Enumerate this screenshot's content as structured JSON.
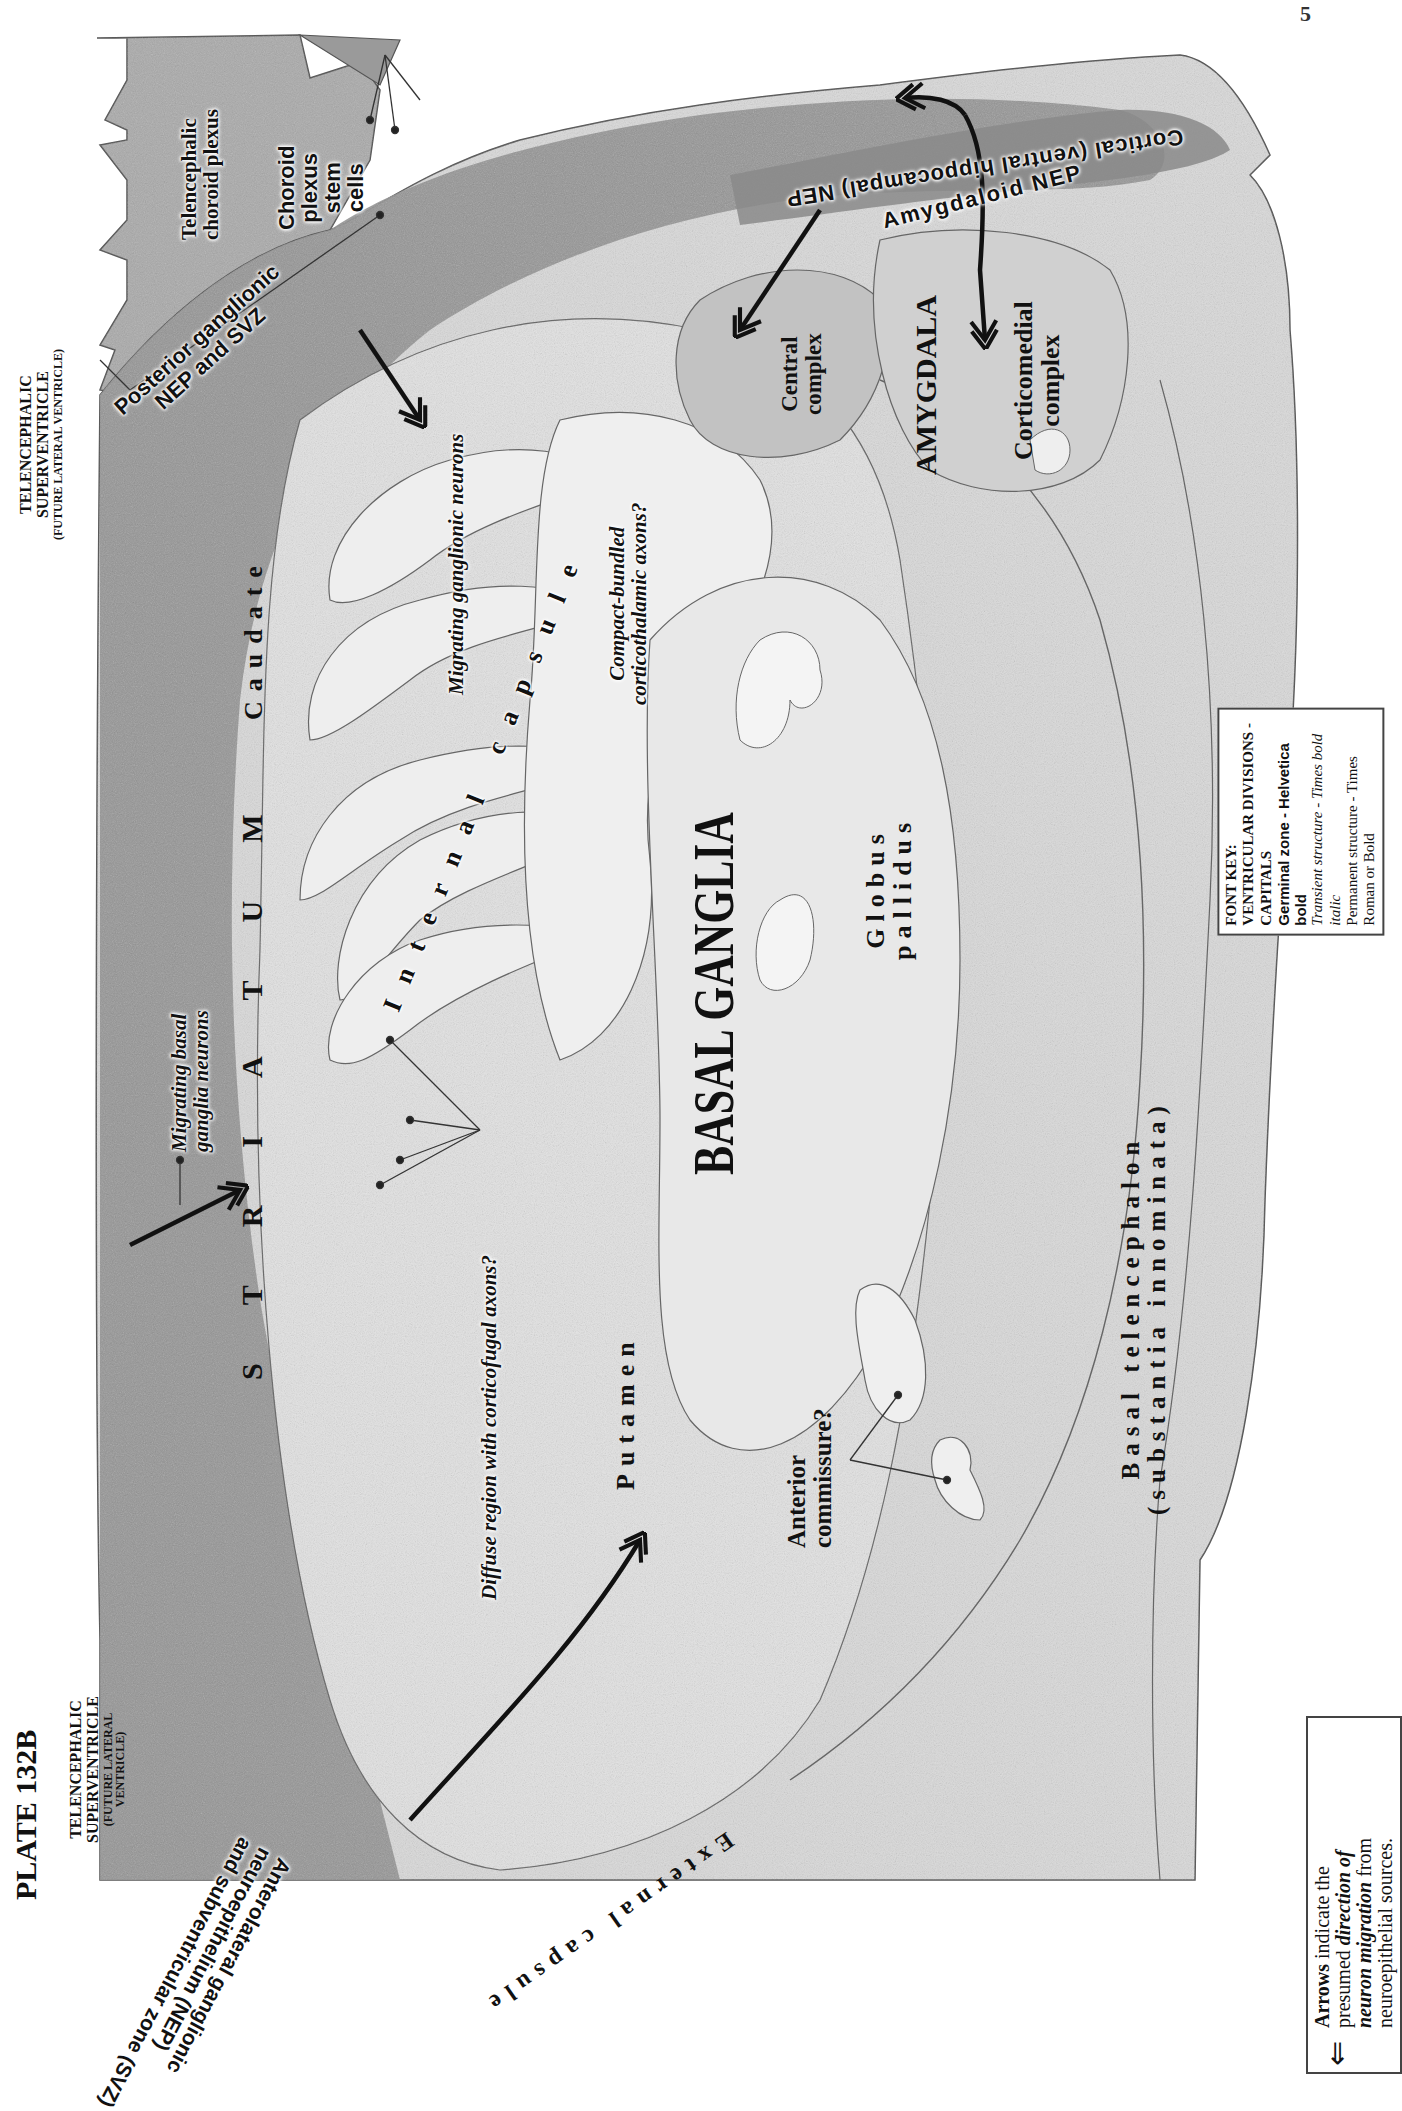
{
  "plate": {
    "title": "PLATE 132B",
    "page_number_fragment": "5"
  },
  "ventricle_labels": {
    "left": {
      "line1": "TELENCEPHALIC",
      "line2": "SUPERVENTRICLE",
      "line3": "(FUTURE LATERAL",
      "line4": "VENTRICLE)"
    },
    "top": {
      "line1": "TELENCEPHALIC",
      "line2": "SUPERVENTRICLE",
      "line3": "(FUTURE LATERAL VENTRICLE)"
    }
  },
  "germinal_zones": {
    "anterolateral": {
      "line1": "Anterolateral ganglionic",
      "line2": "neuroepithelium (NEP)",
      "line3": "and subventricular zone (SVZ)"
    },
    "posterior": {
      "line1": "Posterior ganglionic",
      "line2": "NEP and SVZ"
    },
    "amygdaloid": "Amygdaloid NEP",
    "cortical": "Cortical (ventral hippocampal) NEP",
    "choroid_stem": {
      "line1": "Choroid",
      "line2": "plexus",
      "line3": "stem",
      "line4": "cells"
    }
  },
  "structures": {
    "choroid_plexus": {
      "line1": "Telencephalic",
      "line2": "choroid plexus"
    },
    "caudate": "Caudate",
    "striatum": [
      "S",
      "T",
      "R",
      "I",
      "A",
      "T",
      "U",
      "M"
    ],
    "internal_capsule": "Internal capsule",
    "external_capsule": "External capsule",
    "putamen": "Putamen",
    "basal_ganglia": "BASAL GANGLIA",
    "globus_pallidus": {
      "line1": "Globus",
      "line2": "pallidus"
    },
    "amygdala": "AMYGDALA",
    "central_complex": {
      "line1": "Central",
      "line2": "complex"
    },
    "corticomedial_complex": {
      "line1": "Corticomedial",
      "line2": "complex"
    },
    "anterior_commissure": {
      "line1": "Anterior",
      "line2": "commissure?"
    },
    "basal_telencephalon": {
      "line1": "Basal telencephalon",
      "line2": "(substantia innominata)"
    }
  },
  "transient_labels": {
    "migrating_basal": {
      "line1": "Migrating basal",
      "line2": "ganglia neurons"
    },
    "migrating_ganglionic": "Migrating ganglionic neurons",
    "compact_bundled": {
      "line1": "Compact-bundled",
      "line2": "corticothalamic axons?"
    },
    "diffuse_region": "Diffuse region with corticofugal axons?"
  },
  "font_key": {
    "title": "FONT KEY:",
    "lines": [
      {
        "style": "caps",
        "text": "VENTRICULAR DIVISIONS - CAPITALS"
      },
      {
        "style": "helv",
        "text": "Germinal zone - Helvetica bold"
      },
      {
        "style": "ital",
        "text": "Transient structure - Times bold italic"
      },
      {
        "style": "rom",
        "text": "Permanent structure - Times Roman or Bold"
      }
    ]
  },
  "arrow_legend": {
    "bold_lead": "Arrows",
    "text1": " indicate the",
    "text2": "presumed ",
    "italic1": "direction of",
    "italic2": "neuron migration",
    "text3": " from",
    "text4": "neuroepithelial sources."
  },
  "colors": {
    "germinal_zone": "#8e8e8e",
    "dense_tissue": "#b4b4b4",
    "light_tissue": "#e6e6e6",
    "outline": "#555555",
    "arrow": "#111111"
  }
}
